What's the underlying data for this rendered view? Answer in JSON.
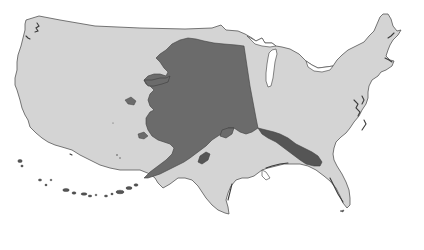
{
  "map": {
    "subject": "Alaska overlaid on contiguous United States size comparison",
    "regions": [
      {
        "name": "Contiguous United States",
        "role": "base",
        "fill": "#d4d4d4"
      },
      {
        "name": "Alaska",
        "role": "overlay",
        "fill": "#6b6b6b"
      }
    ],
    "colors": {
      "background": "#ffffff",
      "conus_fill": "#d4d4d4",
      "conus_outline": "#555555",
      "alaska_fill": "#6b6b6b",
      "alaska_dark_detail": "#3e3e3e",
      "water": "#ffffff"
    },
    "labels": []
  }
}
